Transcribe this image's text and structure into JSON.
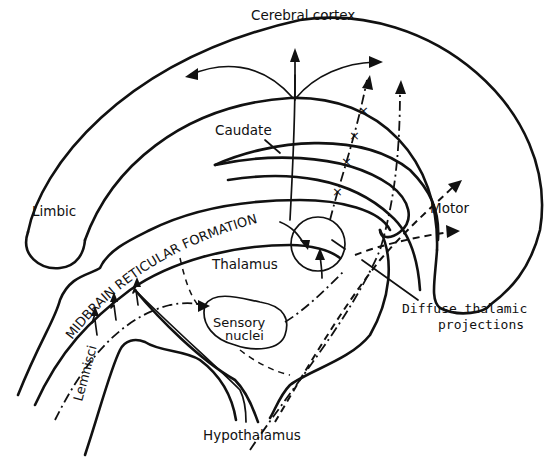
{
  "diagram": {
    "type": "neuroanatomy-schematic",
    "labels": {
      "cerebral_cortex": "Cerebral cortex",
      "caudate": "Caudate",
      "limbic": "Limbic",
      "motor": "Motor",
      "midbrain_reticular_formation": "MIDBRAIN RETICULAR FORMATION",
      "thalamus": "Thalamus",
      "sensory_nuclei_line1": "Sensory",
      "sensory_nuclei_line2": "nuclei",
      "lemnisci": "Lemnisci",
      "hypothalamus": "Hypothalamus",
      "diffuse_line1": "Diffuse thalamic",
      "diffuse_line2": "projections"
    },
    "pathways": [
      {
        "name": "cortical-projection-arrows",
        "style": "solid"
      },
      {
        "name": "reticular-to-thalamus",
        "style": "solid"
      },
      {
        "name": "diffuse-thalamic-projections",
        "style": "dashed"
      },
      {
        "name": "lemniscal-pathway",
        "style": "dash-dot"
      },
      {
        "name": "crossed-pathway",
        "style": "dash-x"
      }
    ],
    "colors": {
      "ink": "#111111",
      "background": "#ffffff"
    }
  }
}
